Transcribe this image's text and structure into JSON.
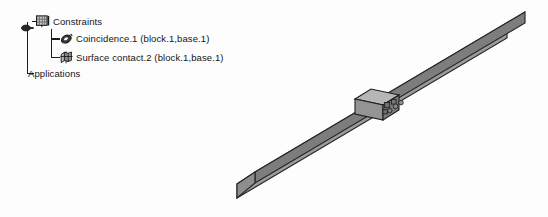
{
  "spec_tree": {
    "name": "specification-tree",
    "root_handle_icon": "tree-root-handle-icon",
    "nodes": [
      {
        "id": "constraints",
        "label": "Constraints",
        "icon": "constraints-folder-icon",
        "depth": 0,
        "expanded": true
      },
      {
        "id": "coincidence",
        "label": "Coincidence.1 (block.1,base.1)",
        "icon": "coincidence-constraint-icon",
        "depth": 1,
        "expanded": false
      },
      {
        "id": "surface-contact",
        "label": "Surface contact.2 (block.1,base.1)",
        "icon": "surface-contact-constraint-icon",
        "depth": 1,
        "expanded": false
      },
      {
        "id": "applications",
        "label": "Applications",
        "icon": "none",
        "depth": 0,
        "expanded": false
      }
    ]
  },
  "viewport": {
    "name": "3d-viewport",
    "background_color": "#ffffff",
    "model": {
      "name": "prismatic-assembly",
      "parts": [
        {
          "id": "base",
          "label": "base.1",
          "shape": "long-rectangular-beam",
          "orientation": "isometric-diagonal",
          "colors": {
            "top_face": "#bdbdbd",
            "front_face": "#9a9a9a",
            "side_face": "#7e7e7e",
            "end_face": "#8d8d8d",
            "outline": "#2b2b2b"
          }
        },
        {
          "id": "block",
          "label": "block.1",
          "shape": "small-cube",
          "position": "on-top-of-base-midspan",
          "colors": {
            "top_face": "#b5b5b5",
            "front_face": "#949494",
            "side_face": "#7a7a7a",
            "outline": "#262626"
          }
        },
        {
          "id": "constraint-symbols",
          "label": "constraint-markers",
          "shape": "small-squares-and-circles",
          "colors": {
            "fill": "#6e6e6e",
            "outline": "#1f1f1f"
          }
        }
      ]
    }
  }
}
